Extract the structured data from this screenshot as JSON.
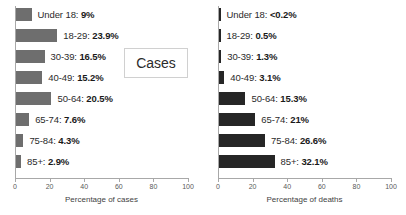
{
  "chart_data": [
    {
      "type": "bar",
      "orientation": "horizontal",
      "title": "Cases",
      "xlabel": "Percentage of cases",
      "ylabel": "",
      "xlim": [
        0,
        100
      ],
      "xticks": [
        0,
        20,
        40,
        60,
        80,
        100
      ],
      "grid": false,
      "legend": "none",
      "bar_color": "#6e6e6e",
      "categories": [
        "Under 18",
        "18-29",
        "30-39",
        "40-49",
        "50-64",
        "65-74",
        "75-84",
        "85+"
      ],
      "values": [
        9,
        23.9,
        16.5,
        15.2,
        20.5,
        7.6,
        4.3,
        2.9
      ],
      "value_labels": [
        "9%",
        "23.9%",
        "16.5%",
        "15.2%",
        "20.5%",
        "7.6%",
        "4.3%",
        "2.9%"
      ]
    },
    {
      "type": "bar",
      "orientation": "horizontal",
      "title": "Deaths",
      "xlabel": "Percentage of deaths",
      "ylabel": "",
      "xlim": [
        0,
        100
      ],
      "xticks": [
        0,
        20,
        40,
        60,
        80,
        100
      ],
      "grid": false,
      "legend": "none",
      "bar_color": "#262626",
      "categories": [
        "Under 18",
        "18-29",
        "30-39",
        "40-49",
        "50-64",
        "65-74",
        "75-84",
        "85+"
      ],
      "values": [
        0.2,
        0.5,
        1.3,
        3.1,
        15.3,
        21,
        26.6,
        32.1
      ],
      "value_labels": [
        "<0.2%",
        "0.5%",
        "1.3%",
        "3.1%",
        "15.3%",
        "21%",
        "26.6%",
        "32.1%"
      ]
    }
  ],
  "panels": [
    {
      "callout": "Cases",
      "axis_title": "Percentage of cases",
      "rows": [
        {
          "category": "Under 18",
          "value_label": "9%",
          "value": 9
        },
        {
          "category": "18-29",
          "value_label": "23.9%",
          "value": 23.9
        },
        {
          "category": "30-39",
          "value_label": "16.5%",
          "value": 16.5
        },
        {
          "category": "40-49",
          "value_label": "15.2%",
          "value": 15.2
        },
        {
          "category": "50-64",
          "value_label": "20.5%",
          "value": 20.5
        },
        {
          "category": "65-74",
          "value_label": "7.6%",
          "value": 7.6
        },
        {
          "category": "75-84",
          "value_label": "4.3%",
          "value": 4.3
        },
        {
          "category": "85+",
          "value_label": "2.9%",
          "value": 2.9
        }
      ],
      "ticks": [
        "0",
        "20",
        "40",
        "60",
        "80",
        "100"
      ]
    },
    {
      "callout": "Deaths",
      "axis_title": "Percentage of deaths",
      "rows": [
        {
          "category": "Under 18",
          "value_label": "<0.2%",
          "value": 0.2
        },
        {
          "category": "18-29",
          "value_label": "0.5%",
          "value": 0.5
        },
        {
          "category": "30-39",
          "value_label": "1.3%",
          "value": 1.3
        },
        {
          "category": "40-49",
          "value_label": "3.1%",
          "value": 3.1
        },
        {
          "category": "50-64",
          "value_label": "15.3%",
          "value": 15.3
        },
        {
          "category": "65-74",
          "value_label": "21%",
          "value": 21
        },
        {
          "category": "75-84",
          "value_label": "26.6%",
          "value": 26.6
        },
        {
          "category": "85+",
          "value_label": "32.1%",
          "value": 32.1
        }
      ],
      "ticks": [
        "0",
        "20",
        "40",
        "60",
        "80",
        "100"
      ]
    }
  ],
  "style": {
    "cases_bar_color": "#6e6e6e",
    "deaths_bar_color": "#262626",
    "axis_color": "#a8a8a8",
    "background": "#ffffff"
  }
}
